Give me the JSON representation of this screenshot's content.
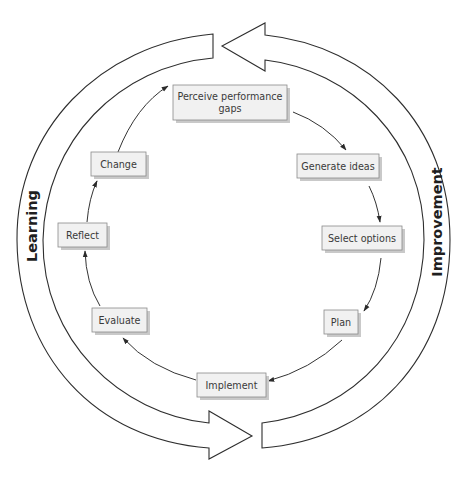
{
  "diagram": {
    "type": "cycle",
    "outer_cycles": [
      {
        "label": "Learning",
        "side": "left",
        "direction": "clockwise-bottom-to-top"
      },
      {
        "label": "Improvement",
        "side": "right",
        "direction": "counterclockwise-bottom-to-top"
      }
    ],
    "steps": [
      {
        "id": "perceive",
        "label_line1": "Perceive performance",
        "label_line2": "gaps"
      },
      {
        "id": "generate",
        "label": "Generate ideas"
      },
      {
        "id": "select",
        "label": "Select options"
      },
      {
        "id": "plan",
        "label": "Plan"
      },
      {
        "id": "implement",
        "label": "Implement"
      },
      {
        "id": "evaluate",
        "label": "Evaluate"
      },
      {
        "id": "reflect",
        "label": "Reflect"
      },
      {
        "id": "change",
        "label": "Change"
      }
    ],
    "flow": [
      [
        "perceive",
        "generate"
      ],
      [
        "generate",
        "select"
      ],
      [
        "select",
        "plan"
      ],
      [
        "plan",
        "implement"
      ],
      [
        "implement",
        "evaluate"
      ],
      [
        "evaluate",
        "reflect"
      ],
      [
        "reflect",
        "change"
      ],
      [
        "change",
        "perceive"
      ]
    ],
    "colors": {
      "box_fill": "#f1f1f1",
      "box_stroke": "#8a8a8a",
      "box_shadow": "#c9c9c9",
      "text": "#3a3a3a",
      "line": "#2e2e2e"
    }
  }
}
